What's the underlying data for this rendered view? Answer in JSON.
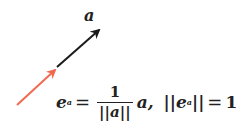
{
  "diagram": {
    "vector_label": "a",
    "unit_vector_color": "#f06a50",
    "vector_color": "#1a1a1a"
  },
  "formula": {
    "lhs": "e",
    "lhs_sub": "a",
    "eq": "=",
    "numerator": "1",
    "denominator": "||a||",
    "times": "a,",
    "norm_open": "||e",
    "norm_sub": "a",
    "norm_close": "||",
    "eq2": "=",
    "rhs": "1"
  }
}
